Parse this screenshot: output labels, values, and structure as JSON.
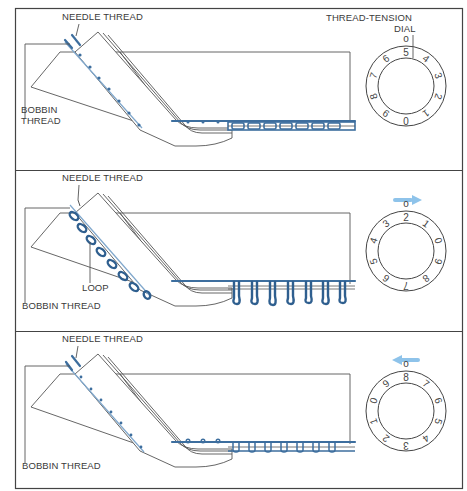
{
  "figure": {
    "colors": {
      "thread": "#3d6e9e",
      "thread_light": "#7fa7cc",
      "arrow": "#8ec3ea",
      "line": "#555555"
    }
  },
  "panels": [
    {
      "id": "balanced",
      "labels": {
        "needle_thread": "NEEDLE THREAD",
        "bobbin_thread_line1": "BOBBIN",
        "bobbin_thread_line2": "THREAD",
        "dial_line1": "THREAD-TENSION",
        "dial_line2": "DIAL"
      },
      "dial": {
        "top_mark": "o",
        "numbers_clockwise_from_top": [
          "5",
          "4",
          "3",
          "2",
          "1",
          "0",
          "9",
          "8",
          "7",
          "6"
        ],
        "arrow": "none"
      },
      "stitch": "balanced"
    },
    {
      "id": "too-loose",
      "labels": {
        "needle_thread": "NEEDLE THREAD",
        "bobbin_thread": "BOBBIN THREAD",
        "loop": "LOOP"
      },
      "dial": {
        "top_mark": "o",
        "numbers_clockwise_from_top": [
          "2",
          "1",
          "0",
          "9",
          "8",
          "7",
          "6",
          "5",
          "4",
          "3"
        ],
        "arrow": "right"
      },
      "stitch": "looped"
    },
    {
      "id": "too-tight",
      "labels": {
        "needle_thread": "NEEDLE THREAD",
        "bobbin_thread": "BOBBIN THREAD"
      },
      "dial": {
        "top_mark": "o",
        "numbers_clockwise_from_top": [
          "8",
          "7",
          "6",
          "5",
          "4",
          "3",
          "2",
          "1",
          "0",
          "9"
        ],
        "arrow": "left"
      },
      "stitch": "tight"
    }
  ]
}
